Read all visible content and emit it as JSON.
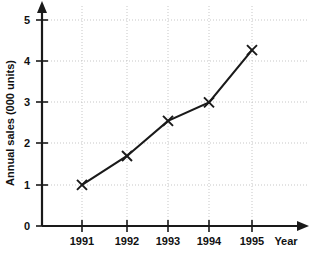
{
  "chart_data": {
    "type": "line",
    "title": "",
    "xlabel": "Year",
    "ylabel": "Annual sales (000 units)",
    "categories": [
      "1991",
      "1992",
      "1993",
      "1994",
      "1995"
    ],
    "values": [
      1.0,
      1.7,
      2.55,
      3.0,
      4.27
    ],
    "series": [
      {
        "name": "Annual sales",
        "values": [
          1.0,
          1.7,
          2.55,
          3.0,
          4.27
        ]
      }
    ],
    "xlim": [
      1990.5,
      1995.5
    ],
    "ylim": [
      0,
      5
    ],
    "ytick_labels": [
      "0",
      "1",
      "2",
      "3",
      "4",
      "5"
    ],
    "ytick_values": [
      0,
      1,
      2,
      3,
      4,
      5
    ],
    "xtick_labels": [
      "1991",
      "1992",
      "1993",
      "1994",
      "1995"
    ],
    "grid": true,
    "grid_style": "dotted",
    "legend": "none",
    "marker": "x",
    "line_color": "#1a1a1a",
    "grid_color": "#b9b9b9",
    "axis_color": "#1a1a1a",
    "axis_arrows": true
  },
  "axes": {
    "y_title": "Annual sales (000 units)",
    "x_title": "Year",
    "y_labels": [
      "5",
      "4",
      "3",
      "2",
      "1",
      "0"
    ],
    "x_labels": [
      "1991",
      "1992",
      "1993",
      "1994",
      "1995"
    ]
  }
}
